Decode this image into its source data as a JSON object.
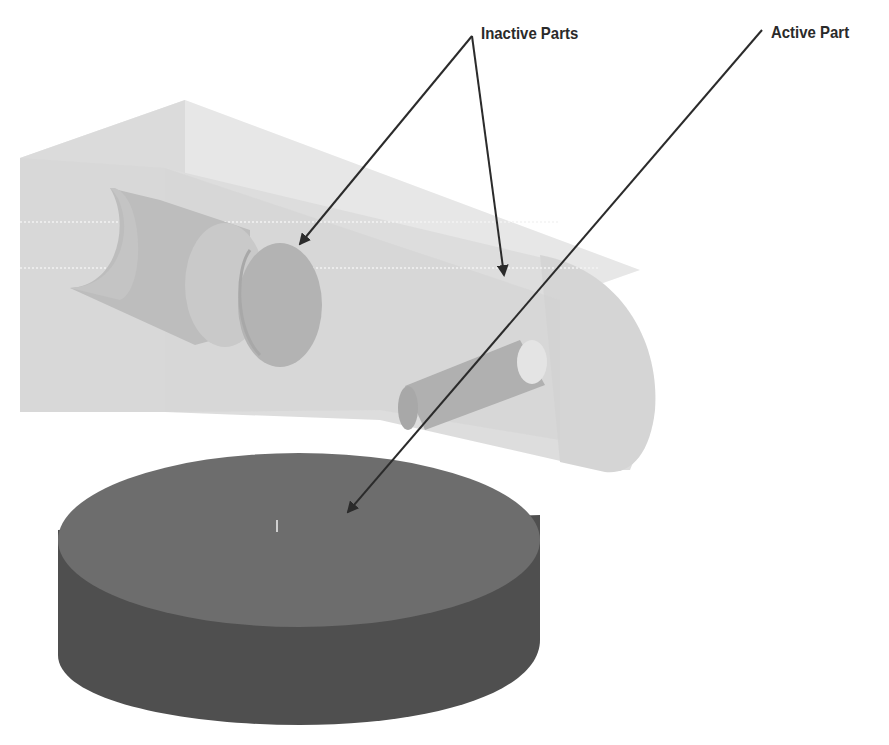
{
  "diagram": {
    "title": "",
    "annotations": [
      {
        "id": "inactive",
        "label": "Inactive Parts",
        "arrow_count": 2
      },
      {
        "id": "active",
        "label": "Active Part",
        "arrow_count": 1
      }
    ],
    "parts": [
      {
        "name": "housing-block",
        "state": "inactive",
        "fill": "#d9d9d9"
      },
      {
        "name": "bore-cylinder",
        "state": "inactive",
        "fill": "#b5b5b5"
      },
      {
        "name": "pin",
        "state": "inactive",
        "fill": "#b0b0b0"
      },
      {
        "name": "disc",
        "state": "active",
        "top_fill": "#6d6d6d",
        "side_fill": "#4f4f4f"
      }
    ],
    "colors": {
      "arrow": "#2b2b2b",
      "background": "#ffffff"
    }
  }
}
